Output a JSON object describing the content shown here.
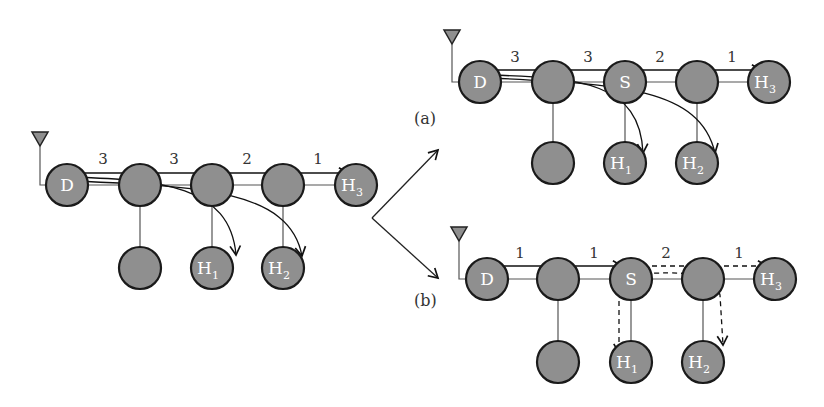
{
  "diagram": {
    "original": {
      "nodes": [
        "D",
        "",
        "",
        "",
        "H3",
        "",
        "H1",
        "H2"
      ],
      "hop_counts": [
        "3",
        "3",
        "2",
        "1"
      ]
    },
    "panel_a": {
      "caption": "(a)",
      "nodes": [
        "D",
        "",
        "S",
        "",
        "H3",
        "",
        "H1",
        "H2"
      ],
      "hop_counts": [
        "3",
        "3",
        "2",
        "1"
      ]
    },
    "panel_b": {
      "caption": "(b)",
      "nodes": [
        "D",
        "",
        "S",
        "",
        "H3",
        "",
        "H1",
        "H2"
      ],
      "hop_counts": [
        "1",
        "1",
        "2",
        "1"
      ]
    },
    "colors": {
      "node_fill": "#8f8f8f",
      "node_stroke": "#1a1a1a"
    }
  }
}
